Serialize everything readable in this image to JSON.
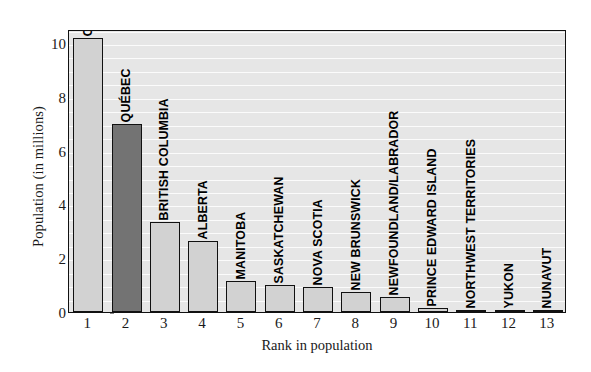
{
  "chart_data": {
    "type": "bar",
    "title": "",
    "xlabel": "Rank in population",
    "ylabel": "Population (in millions)",
    "categories": [
      "ONTARIO",
      "QUÉBEC",
      "BRITISH COLUMBIA",
      "ALBERTA",
      "MANITOBA",
      "SASKATCHEWAN",
      "NOVA SCOTIA",
      "NEW BRUNSWICK",
      "NEWFOUNDLAND/LABRADOR",
      "PRINCE EDWARD ISLAND",
      "NORTHWEST TERRITORIES",
      "YUKON",
      "NUNAVUT"
    ],
    "x": [
      1,
      2,
      3,
      4,
      5,
      6,
      7,
      8,
      9,
      10,
      11,
      12,
      13
    ],
    "xticklabels": [
      "1",
      "2",
      "3",
      "4",
      "5",
      "6",
      "7",
      "8",
      "9",
      "10",
      "11",
      "12",
      "13"
    ],
    "values": [
      10.2,
      7.0,
      3.35,
      2.65,
      1.14,
      1.02,
      0.94,
      0.76,
      0.55,
      0.14,
      0.04,
      0.03,
      0.03
    ],
    "bar_colors": [
      "light",
      "dark",
      "light",
      "light",
      "light",
      "light",
      "light",
      "light",
      "light",
      "light",
      "light",
      "light",
      "light"
    ],
    "yticks": [
      0,
      2,
      4,
      6,
      8,
      10
    ],
    "yticklabels": [
      "0",
      "2",
      "4",
      "6",
      "8",
      "10"
    ],
    "ylim": [
      0,
      10.52
    ],
    "xlim": [
      0.5,
      13.5
    ],
    "gridlines_y": [
      0.5,
      1,
      1.5,
      2,
      2.5,
      3,
      3.5,
      4,
      4.5,
      5,
      5.5,
      6,
      6.5,
      7,
      7.5,
      8,
      8.5,
      9,
      9.5,
      10,
      10.5
    ],
    "grid": true,
    "legend": "none",
    "colors": {
      "bar_light": "#d2d2d2",
      "bar_dark": "#737373",
      "plot_background": "#e6e6e6",
      "gridline": "#fbfbfb",
      "axis": "#111111",
      "text": "#1a1a1a"
    }
  }
}
